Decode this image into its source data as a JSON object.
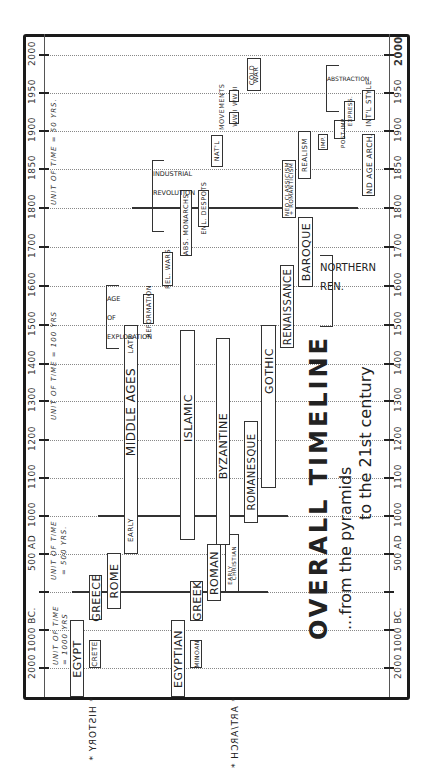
{
  "title": {
    "main": "OVERALL TIMELINE",
    "subtitle_line1": "...from the pyramids",
    "subtitle_line2": "to the 21st century"
  },
  "sections": {
    "history": "* HISTORY *",
    "art_arch": "* ART/ARCH *"
  },
  "axis": {
    "ticks": [
      {
        "label": "2000",
        "y": 55
      },
      {
        "label": "1950",
        "y": 93
      },
      {
        "label": "1900",
        "y": 131
      },
      {
        "label": "1850",
        "y": 169
      },
      {
        "label": "1800",
        "y": 208
      },
      {
        "label": "1700",
        "y": 247
      },
      {
        "label": "1600",
        "y": 286
      },
      {
        "label": "1500",
        "y": 325
      },
      {
        "label": "1400",
        "y": 364
      },
      {
        "label": "1300",
        "y": 401
      },
      {
        "label": "1200",
        "y": 440
      },
      {
        "label": "1100",
        "y": 478
      },
      {
        "label": "1000",
        "y": 516
      },
      {
        "label": "500 AD",
        "y": 554
      },
      {
        "label": "",
        "y": 592
      },
      {
        "label": "1000 BC.",
        "y": 630
      },
      {
        "label": "2000",
        "y": 668
      }
    ],
    "units": {
      "u50": "UNIT OF TIME = 50 YRS.",
      "u100": "UNIT OF TIME = 100 YRS",
      "u500a": "UNIT OF TIME",
      "u500b": "= 500 YRS.",
      "u1000a": "UNIT OF TIME",
      "u1000b": "= 1000 YRS"
    }
  },
  "history": {
    "egypt": "EGYPT",
    "crete": "CRETE",
    "greece": "GREECE",
    "rome": "ROME",
    "middle_ages": "MIDDLE     AGES",
    "early": "EARLY",
    "late": "LATE",
    "age_of_exploration": "AGE OF EXPLORATION",
    "reformation": "REFORMATION",
    "rel_wars": "REL. WARS",
    "abs_monarchs": "ABS. MONARCHS",
    "enl_despots": "ENL. DESPOTS",
    "industrial_revolution": "INDUSTRIAL REVOLUTION",
    "natl_movements_a": "NAT'L",
    "natl_movements_b": "MOVEMENTS",
    "ww1": "WW I",
    "ww2": "WW II",
    "cold_war_a": "COLD",
    "cold_war_b": "WAR"
  },
  "art": {
    "egyptian": "EGYPTIAN",
    "minoan": "MINOAN",
    "greek": "GREEK",
    "roman": "ROMAN",
    "early_christian_a": "EARLY",
    "early_christian_b": "CHRISTIAN",
    "islamic": "ISLAMIC",
    "byzantine": "BYZANTINE",
    "romanesque": "ROMANESQUE",
    "gothic": "GOTHIC",
    "renaissance": "RENAISSANCE",
    "baroque": "BAROQUE",
    "northern_ren": "NORTHERN REN.",
    "neo_classicism_a": "NEO CLASSICISM",
    "neo_classicism_b": "+ ROMANTICISM",
    "realism": "REALISM",
    "imp": "IMP.",
    "post_imp": "POST-IMP.",
    "express": "EXPRESS.",
    "abstraction": "ABSTRACTION",
    "ind_age_arch": "IND AGE ARCH.",
    "intl_style": "INT'L STYLE"
  }
}
